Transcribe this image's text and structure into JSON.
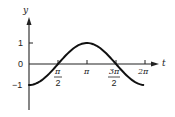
{
  "chart_data": {
    "type": "line",
    "title": "",
    "xlabel": "t",
    "ylabel": "y",
    "function": "y = -cos(t)",
    "xlim": [
      0,
      6.2832
    ],
    "ylim": [
      -1,
      1
    ],
    "grid": false,
    "legend": null,
    "x_ticks": [
      {
        "value": 1.5708,
        "num": "π",
        "den": "2"
      },
      {
        "value": 3.1416,
        "label": "π"
      },
      {
        "value": 4.7124,
        "num": "3π",
        "den": "2"
      },
      {
        "value": 6.2832,
        "label": "2π"
      }
    ],
    "y_ticks": [
      {
        "value": 1,
        "label": "1"
      },
      {
        "value": 0,
        "label": "0"
      },
      {
        "value": -1,
        "label": "-1"
      }
    ],
    "series": [
      {
        "name": "-cos(t)",
        "x": [
          0,
          0.7854,
          1.5708,
          2.3562,
          3.1416,
          3.927,
          4.7124,
          5.4978,
          6.2832
        ],
        "y": [
          -1,
          -0.707,
          0,
          0.707,
          1,
          0.707,
          0,
          -0.707,
          -1
        ]
      }
    ]
  },
  "labels": {
    "y_axis": "y",
    "x_axis": "t",
    "y_tick_1": "1",
    "y_tick_0": "0",
    "y_tick_neg1": "−1",
    "x_tick_pi_over_2_num": "π",
    "x_tick_pi_over_2_den": "2",
    "x_tick_pi": "π",
    "x_tick_3pi_over_2_num": "3π",
    "x_tick_3pi_over_2_den": "2",
    "x_tick_2pi": "2π"
  }
}
